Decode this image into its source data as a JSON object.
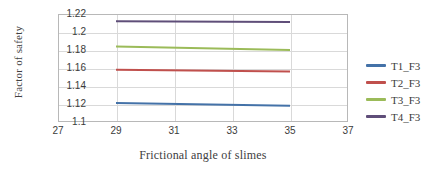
{
  "chart_data": {
    "type": "line",
    "title": "",
    "xlabel": "Frictional angle of slimes",
    "ylabel": "Factor of safety",
    "xlim": [
      27,
      37
    ],
    "ylim": [
      1.1,
      1.22
    ],
    "xticks": [
      "27",
      "29",
      "31",
      "33",
      "35",
      "37"
    ],
    "yticks": [
      "1.22",
      "1.2",
      "1.18",
      "1.16",
      "1.14",
      "1.12",
      "1.1"
    ],
    "grid": "horizontal-and-vertical",
    "legend_position": "right",
    "x": [
      29,
      35
    ],
    "series": [
      {
        "name": "T1_F3",
        "color": "#4472a8",
        "values": [
          1.121,
          1.118
        ]
      },
      {
        "name": "T2_F3",
        "color": "#c0504d",
        "values": [
          1.158,
          1.156
        ]
      },
      {
        "name": "T3_F3",
        "color": "#9bbb59",
        "values": [
          1.184,
          1.18
        ]
      },
      {
        "name": "T4_F3",
        "color": "#5f4e79",
        "values": [
          1.212,
          1.211
        ]
      }
    ]
  },
  "legend": {
    "items": [
      {
        "label": "T1_F3"
      },
      {
        "label": "T2_F3"
      },
      {
        "label": "T3_F3"
      },
      {
        "label": "T4_F3"
      }
    ]
  }
}
